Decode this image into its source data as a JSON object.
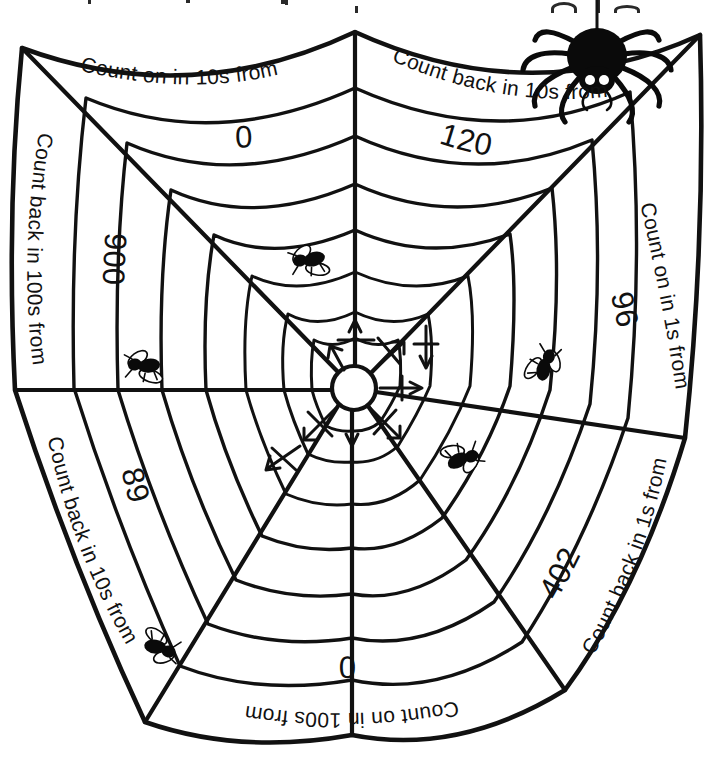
{
  "worksheet": {
    "title": "Spider web counting sequences",
    "page_width": 710,
    "page_height": 757,
    "background_color": "#ffffff",
    "ink_color": "#111111"
  },
  "sectors": [
    {
      "id": "top-left",
      "position": "top-left",
      "label": "Count on in 10s from",
      "value": "0",
      "direction": "on",
      "step": 10,
      "start": 0,
      "text_rotation_deg": -14
    },
    {
      "id": "top-right",
      "position": "top-right",
      "label": "Count back in 10s from",
      "value": "120",
      "direction": "back",
      "step": 10,
      "start": 120,
      "text_rotation_deg": 20
    },
    {
      "id": "left-upper",
      "position": "left-upper",
      "label": "Count back in 100s from",
      "value": "900",
      "direction": "back",
      "step": 100,
      "start": 900,
      "text_rotation_deg": -76
    },
    {
      "id": "right-upper",
      "position": "right-upper",
      "label": "Count on in 1s from",
      "value": "96",
      "direction": "on",
      "step": 1,
      "start": 96,
      "text_rotation_deg": 78
    },
    {
      "id": "left-lower",
      "position": "left-lower",
      "label": "Count back in 10s from",
      "value": "89",
      "direction": "back",
      "step": 10,
      "start": 89,
      "text_rotation_deg": -115
    },
    {
      "id": "right-lower",
      "position": "right-lower",
      "label": "Count back in 1s from",
      "value": "402",
      "direction": "back",
      "step": 1,
      "start": 402,
      "text_rotation_deg": 116
    },
    {
      "id": "bottom",
      "position": "bottom",
      "label": "Count on in 100s from",
      "value": "0",
      "direction": "on",
      "step": 100,
      "start": 0,
      "text_rotation_deg": 180
    }
  ],
  "creatures": {
    "spider": {
      "name": "spider",
      "hanging_from_thread": true,
      "x": 597,
      "y": 56,
      "body_color": "#0a0a0a",
      "eye_color": "#ffffff",
      "leg_count": 8
    },
    "flies": [
      {
        "name": "fly",
        "x": 311,
        "y": 259,
        "rotation_deg": -18,
        "scale": 1.0
      },
      {
        "name": "fly",
        "x": 146,
        "y": 365,
        "rotation_deg": -8,
        "scale": 1.0
      },
      {
        "name": "fly",
        "x": 545,
        "y": 367,
        "rotation_deg": 100,
        "scale": 1.0
      },
      {
        "name": "fly",
        "x": 461,
        "y": 460,
        "rotation_deg": 150,
        "scale": 1.0
      },
      {
        "name": "fly",
        "x": 158,
        "y": 648,
        "rotation_deg": 188,
        "scale": 1.0
      }
    ]
  },
  "web": {
    "hub": {
      "x": 354,
      "y": 388,
      "radius": 22
    },
    "anchor_points": [
      {
        "name": "top",
        "x": 355,
        "y": 32
      },
      {
        "name": "upper-right",
        "x": 700,
        "y": 35
      },
      {
        "name": "right",
        "x": 685,
        "y": 438
      },
      {
        "name": "lower-right",
        "x": 565,
        "y": 690
      },
      {
        "name": "bottom",
        "x": 352,
        "y": 735
      },
      {
        "name": "lower-left",
        "x": 145,
        "y": 722
      },
      {
        "name": "left",
        "x": 15,
        "y": 390
      },
      {
        "name": "upper-left",
        "x": 22,
        "y": 48
      }
    ],
    "ring_count": 9,
    "spoke_count": 8,
    "hub_arrow_count": 8
  }
}
